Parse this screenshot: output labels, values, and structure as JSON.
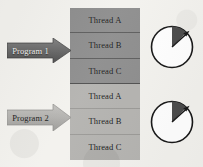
{
  "diagram": {
    "background_color": "#f3f2ee"
  },
  "programs": [
    {
      "label": "Program 1",
      "arrow_name": "arrow-program-1",
      "fill_color": "#6e6e6e",
      "text_color": "#efeeec",
      "threads": [
        {
          "label": "Thread A"
        },
        {
          "label": "Thread B"
        },
        {
          "label": "Thread C"
        }
      ],
      "group_color": "#8d8d8d",
      "clock": {
        "name": "clock-program-1",
        "wedge_start_deg": 0,
        "wedge_end_deg": 45,
        "wedge_color": "#4a4a4a",
        "face_color": "#ffffff",
        "outline_color": "#1a1a1a",
        "hand_angle_deg": 45
      }
    },
    {
      "label": "Program 2",
      "arrow_name": "arrow-program-2",
      "fill_color": "#b2b1ae",
      "text_color": "#1a1a1a",
      "threads": [
        {
          "label": "Thread A"
        },
        {
          "label": "Thread B"
        },
        {
          "label": "Thread C"
        }
      ],
      "group_color": "#b4b3b0",
      "clock": {
        "name": "clock-program-2",
        "wedge_start_deg": 0,
        "wedge_end_deg": 45,
        "wedge_color": "#4a4a4a",
        "face_color": "#ffffff",
        "outline_color": "#1a1a1a",
        "hand_angle_deg": 45
      }
    }
  ]
}
